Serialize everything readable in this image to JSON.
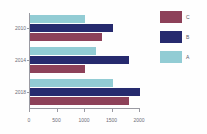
{
  "chart_data": {
    "type": "bar",
    "orientation": "horizontal",
    "title": "",
    "subtitle": "",
    "xlabel": "",
    "ylabel": "",
    "categories": [
      "2010",
      "2014",
      "2018"
    ],
    "series": [
      {
        "name": "A",
        "color": "#92ccd4",
        "values": [
          1000,
          1200,
          1500
        ]
      },
      {
        "name": "B",
        "color": "#262a6e",
        "values": [
          1500,
          1800,
          2000
        ]
      },
      {
        "name": "C",
        "color": "#8d4159",
        "values": [
          1300,
          1000,
          1800
        ]
      }
    ],
    "series_order_top_to_bottom": [
      "A",
      "B",
      "C"
    ],
    "xlim": [
      0,
      2000
    ],
    "xticks": [
      0,
      500,
      1000,
      1500,
      2000
    ],
    "xtick_labels": [
      "0",
      "500",
      "1000",
      "1500",
      "2000"
    ],
    "grid": false,
    "legend_position": "right",
    "legend_order_top_to_bottom": [
      "C",
      "B",
      "A"
    ],
    "background_color": "#fefefe",
    "axis_color": "#9a9aa2",
    "text_color": "#6d6d77"
  },
  "legend": {
    "entries": [
      {
        "label": "C",
        "color": "#8d4159"
      },
      {
        "label": "B",
        "color": "#262a6e"
      },
      {
        "label": "A",
        "color": "#92ccd4"
      }
    ]
  },
  "axes": {
    "x": {
      "ticks": [
        {
          "value": 0,
          "label": "0"
        },
        {
          "value": 500,
          "label": "500"
        },
        {
          "value": 1000,
          "label": "1000"
        },
        {
          "value": 1500,
          "label": "1500"
        },
        {
          "value": 2000,
          "label": "2000"
        }
      ]
    },
    "y": {
      "ticks": [
        {
          "label": "2010"
        },
        {
          "label": "2014"
        },
        {
          "label": "2018"
        }
      ]
    }
  }
}
